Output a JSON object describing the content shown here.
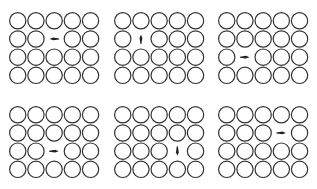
{
  "figure": {
    "rows": 4,
    "cols": 5,
    "circle_diameter": 17.5,
    "spacing": 18.2,
    "stroke_color": "#333333",
    "arrow_color": "#222222",
    "panels": [
      {
        "id": "panel-1",
        "x": 8,
        "y": 11,
        "vacancy": {
          "row": 1,
          "col": 2
        },
        "arrow": "left"
      },
      {
        "id": "panel-2",
        "x": 113,
        "y": 11,
        "vacancy": {
          "row": 1,
          "col": 1
        },
        "arrow": "up"
      },
      {
        "id": "panel-3",
        "x": 217,
        "y": 11,
        "vacancy": {
          "row": 2,
          "col": 1
        },
        "arrow": "right"
      },
      {
        "id": "panel-4",
        "x": 8,
        "y": 105,
        "vacancy": {
          "row": 2,
          "col": 2
        },
        "arrow": "right"
      },
      {
        "id": "panel-5",
        "x": 113,
        "y": 105,
        "vacancy": {
          "row": 2,
          "col": 3
        },
        "arrow": "down"
      },
      {
        "id": "panel-6",
        "x": 217,
        "y": 105,
        "vacancy": {
          "row": 1,
          "col": 3
        },
        "arrow": "right"
      }
    ]
  }
}
